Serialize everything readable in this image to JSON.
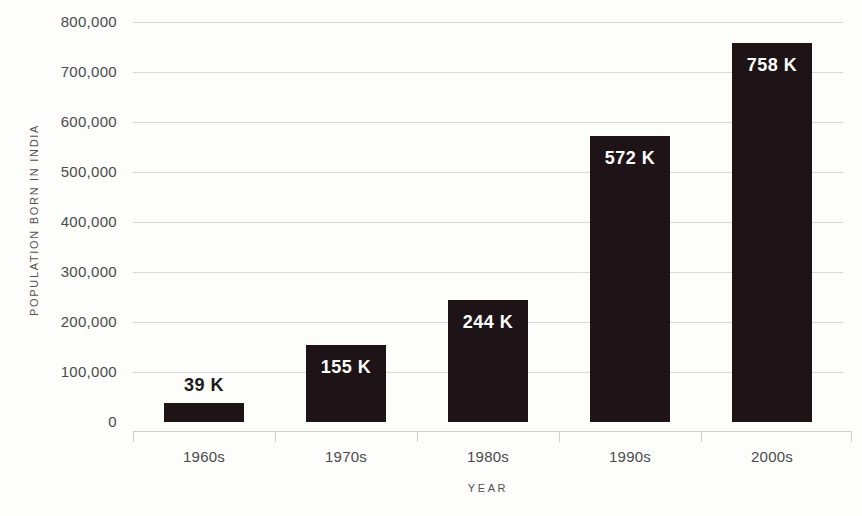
{
  "chart_data": {
    "type": "bar",
    "title": "",
    "xlabel": "YEAR",
    "ylabel": "POPULATION BORN IN INDIA",
    "categories": [
      "1960s",
      "1970s",
      "1980s",
      "1990s",
      "2000s"
    ],
    "values": [
      39000,
      155000,
      244000,
      572000,
      758000
    ],
    "data_labels": [
      "39 K",
      "155 K",
      "244 K",
      "572 K",
      "758 K"
    ],
    "label_placement": [
      "outside",
      "inside",
      "inside",
      "inside",
      "inside"
    ],
    "ylim": [
      0,
      800000
    ],
    "ytick_values": [
      0,
      100000,
      200000,
      300000,
      400000,
      500000,
      600000,
      700000,
      800000
    ],
    "ytick_labels": [
      "0",
      "100,000",
      "200,000",
      "300,000",
      "400,000",
      "500,000",
      "600,000",
      "700,000",
      "800,000"
    ],
    "grid": true,
    "legend": null,
    "bar_color": "#1e1418",
    "grid_color": "#d9d9d9",
    "axis_color": "#cfcfcf",
    "background_color": "#fdfdfc",
    "label_color_inside": "#ffffff",
    "label_color_outside": "#1a1a1a"
  }
}
